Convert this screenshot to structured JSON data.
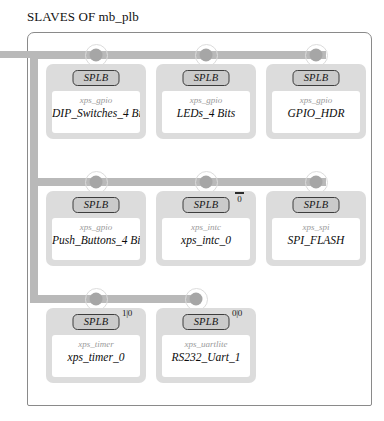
{
  "diagram": {
    "title": "SLAVES OF mb_plb",
    "bus_name": "mb_plb",
    "badge_label": "SPLB",
    "colors": {
      "bus": "#b9b9b9",
      "node": "#a6a6a6",
      "block_fill": "#dcdcdc",
      "block_inner": "#ffffff",
      "frame_border": "#8a8a8a",
      "text": "#0c0c0c",
      "type_text": "#9a9a9a"
    },
    "rows": [
      {
        "blocks": [
          {
            "badge": "SPLB",
            "type": "xps_gpio",
            "name": "DIP_Switches_4 Bits"
          },
          {
            "badge": "SPLB",
            "type": "xps_gpio",
            "name": "LEDs_4 Bits"
          },
          {
            "badge": "SPLB",
            "type": "xps_gpio",
            "name": "GPIO_HDR"
          }
        ]
      },
      {
        "blocks": [
          {
            "badge": "SPLB",
            "type": "xps_gpio",
            "name": "Push_Buttons_4 Bits"
          },
          {
            "badge": "SPLB",
            "type": "xps_intc",
            "name": "xps_intc_0"
          },
          {
            "badge": "SPLB",
            "type": "xps_spi",
            "name": "SPI_FLASH"
          }
        ]
      },
      {
        "blocks": [
          {
            "badge": "SPLB",
            "type": "xps_timer",
            "name": "xps_timer_0"
          },
          {
            "badge": "SPLB",
            "type": "xps_uartlite",
            "name": "RS232_Uart_1"
          }
        ]
      }
    ],
    "markers": {
      "intc_port": "0",
      "timer_port": "1|0",
      "uart_port": "0|0"
    }
  }
}
